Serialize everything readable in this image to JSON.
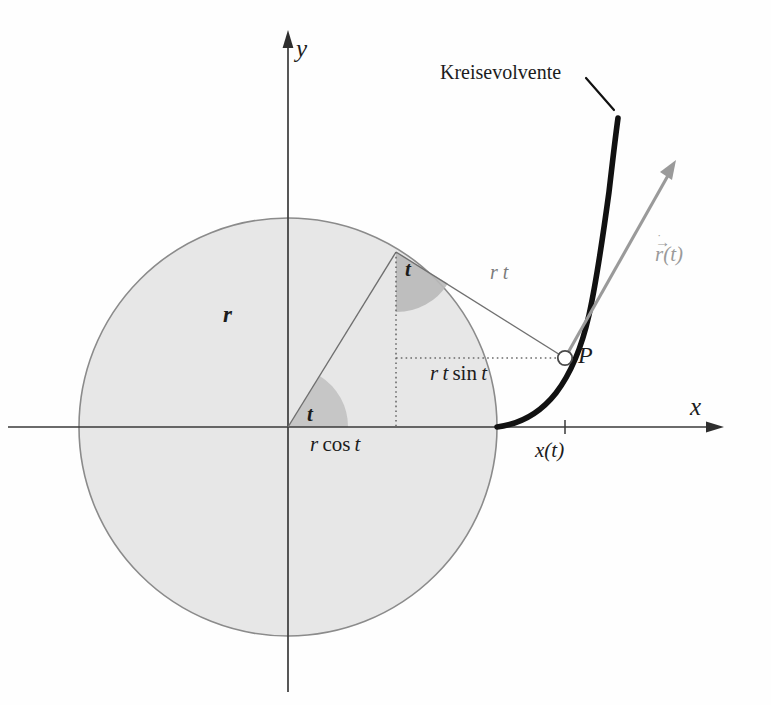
{
  "figure": {
    "title": "Kreisevolvente",
    "axes": {
      "x_label": "x",
      "y_label": "y"
    },
    "labels": {
      "curve_name": "Kreisevolvente",
      "radius": "r",
      "tangent_length": "r t",
      "vertical_component": "r t sin t",
      "horizontal_component": "r cos t",
      "angle_at_origin": "t",
      "angle_at_tangent": "t",
      "point": "P",
      "x_coordinate": "x(t)",
      "velocity_vector_base": "r",
      "velocity_vector_arg": "(t)",
      "velocity_vector_arrow": "→",
      "velocity_vector_dot": "˙"
    },
    "colors": {
      "disk_fill": "#e6e6e6",
      "disk_stroke": "#8a8a8a",
      "wedge_fill": "#c3c3c3",
      "axis": "#3a3a3a",
      "involute": "#111111",
      "construction": "#757575",
      "vector": "#9a9a9a",
      "text": "#1c1c1c"
    },
    "geometry": {
      "center_x": 288,
      "center_y": 427,
      "radius": 209,
      "tangent_point_x": 396,
      "tangent_point_y": 252,
      "point_p_x": 565,
      "point_p_y": 358,
      "vector_tip_x": 676,
      "vector_tip_y": 163,
      "angle_t_degrees": 58
    }
  }
}
